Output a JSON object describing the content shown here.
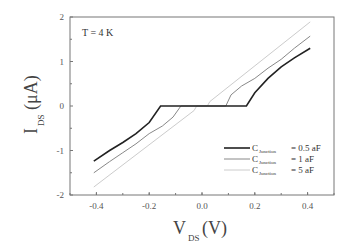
{
  "chart_data": {
    "type": "line",
    "title": "",
    "annotation": "T = 4 K",
    "xlabel": "V_DS(V)",
    "ylabel": "I_DS(μA)",
    "xlabel_main": "V",
    "xlabel_sub": "DS",
    "xlabel_unit": "(V)",
    "ylabel_main": "I",
    "ylabel_sub": "DS",
    "ylabel_unit": "(μA)",
    "xlim": [
      -0.5,
      0.5
    ],
    "ylim": [
      -2,
      2
    ],
    "xticks": [
      -0.4,
      -0.2,
      0.0,
      0.2,
      0.4
    ],
    "xtick_labels": [
      "-0.4",
      "-0.2",
      "0.0",
      "0.2",
      "0.4"
    ],
    "yticks": [
      -2,
      -1,
      0,
      1,
      2
    ],
    "ytick_labels": [
      "-2",
      "-1",
      "0",
      "1",
      "2"
    ],
    "grid": false,
    "legend_position": "lower right",
    "series": [
      {
        "name": "C_Junction = 0.5 aF",
        "legend_main": "C",
        "legend_sub": "Junction",
        "legend_value": "= 0.5 aF",
        "color": "#222222",
        "width": 1.6,
        "x": [
          -0.41,
          -0.35,
          -0.3,
          -0.25,
          -0.2,
          -0.157,
          -0.157,
          0.168,
          0.168,
          0.2,
          0.25,
          0.3,
          0.35,
          0.41
        ],
        "y": [
          -1.24,
          -1.0,
          -0.82,
          -0.62,
          -0.37,
          0.0,
          0.0,
          0.0,
          0.0,
          0.3,
          0.62,
          0.88,
          1.08,
          1.3
        ]
      },
      {
        "name": "C_Junction = 1 aF",
        "legend_main": "C",
        "legend_sub": "Junction",
        "legend_value": "= 1 aF",
        "color": "#888888",
        "width": 1.0,
        "x": [
          -0.41,
          -0.35,
          -0.3,
          -0.25,
          -0.2,
          -0.15,
          -0.11,
          -0.08,
          0.09,
          0.11,
          0.15,
          0.2,
          0.25,
          0.3,
          0.35,
          0.41
        ],
        "y": [
          -1.5,
          -1.25,
          -1.05,
          -0.85,
          -0.62,
          -0.45,
          -0.25,
          0.0,
          0.0,
          0.25,
          0.45,
          0.62,
          0.85,
          1.05,
          1.3,
          1.57
        ]
      },
      {
        "name": "C_Junction = 5 aF",
        "legend_main": "C",
        "legend_sub": "Junction",
        "legend_value": "= 5 aF",
        "color": "#cccccc",
        "width": 1.0,
        "x": [
          -0.41,
          -0.03,
          -0.02,
          0.02,
          0.03,
          0.41
        ],
        "y": [
          -1.82,
          -0.1,
          0.0,
          0.0,
          0.1,
          1.89
        ]
      }
    ]
  }
}
